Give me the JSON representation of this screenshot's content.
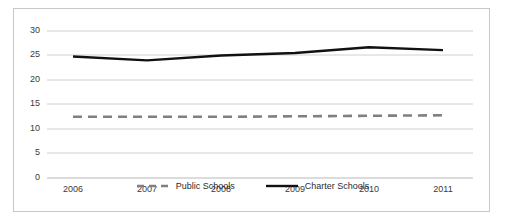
{
  "chart_data": {
    "type": "line",
    "title": "",
    "subtitle": "",
    "xlabel": "",
    "ylabel": "",
    "categories": [
      "2006",
      "2007",
      "2008",
      "2009",
      "2010",
      "2011"
    ],
    "x": [
      2006,
      2007,
      2008,
      2009,
      2010,
      2011
    ],
    "series": [
      {
        "name": "Public Schools",
        "style": "dashed",
        "color": "#808080",
        "values": [
          12.5,
          12.5,
          12.5,
          12.6,
          12.7,
          12.8
        ]
      },
      {
        "name": "Charter Schools",
        "style": "solid",
        "color": "#111111",
        "values": [
          24.8,
          24.0,
          25.0,
          25.5,
          26.7,
          26.1
        ]
      }
    ],
    "ylim": [
      0,
      30
    ],
    "yticks": [
      0,
      5,
      10,
      15,
      20,
      25,
      30
    ],
    "ytick_labels": [
      "0",
      "5",
      "10",
      "15",
      "20",
      "25",
      "30"
    ],
    "xtick_labels": [
      "2006",
      "2007",
      "2008",
      "2009",
      "2010",
      "2011"
    ],
    "grid": "horizontal",
    "legend_position": "bottom",
    "annotations": []
  },
  "axes": {
    "y_ticks": [
      {
        "label": "30",
        "value": 30
      },
      {
        "label": "25",
        "value": 25
      },
      {
        "label": "20",
        "value": 20
      },
      {
        "label": "15",
        "value": 15
      },
      {
        "label": "10",
        "value": 10
      },
      {
        "label": "5",
        "value": 5
      },
      {
        "label": "0",
        "value": 0
      }
    ],
    "x_ticks": [
      {
        "label": "2006"
      },
      {
        "label": "2007"
      },
      {
        "label": "2008"
      },
      {
        "label": "2009"
      },
      {
        "label": "2010"
      },
      {
        "label": "2011"
      }
    ]
  },
  "legend": {
    "items": [
      {
        "label": "Public Schools",
        "style": "dashed",
        "color": "#808080"
      },
      {
        "label": "Charter Schools",
        "style": "solid",
        "color": "#111111"
      }
    ]
  },
  "style": {
    "frame_border_color": "#c8c8c8",
    "gridline_color": "#d0d0d0",
    "background": "#ffffff",
    "text_color": "#3a3a3a"
  }
}
